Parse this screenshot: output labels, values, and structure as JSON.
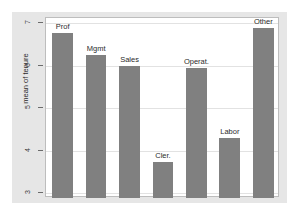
{
  "chart_data": {
    "type": "bar",
    "title": "",
    "xlabel": "",
    "ylabel": "mean of tenure",
    "categories": [
      "Prof",
      "Mgmt",
      "Sales",
      "Cler.",
      "Operat.",
      "Labor",
      "Other"
    ],
    "values": [
      6.77,
      6.24,
      5.99,
      3.74,
      5.94,
      4.29,
      6.89
    ],
    "ylim": [
      3,
      7
    ],
    "yticks": [
      3,
      4,
      5,
      6,
      7
    ],
    "ytick_labels": [
      "3",
      "4",
      "5",
      "6",
      "7"
    ],
    "grid": true,
    "legend": "none",
    "bar_color": "#808080",
    "panel_bg": "#ffffff",
    "figure_bg": "#e6e6e6",
    "axis_color": "#6b6b6b"
  },
  "axis": {
    "y_title": "mean of tenure"
  },
  "ticks": [
    {
      "label": "7",
      "value": 7
    },
    {
      "label": "6",
      "value": 6
    },
    {
      "label": "5",
      "value": 5
    },
    {
      "label": "4",
      "value": 4
    },
    {
      "label": "3",
      "value": 3
    }
  ],
  "bars": [
    {
      "label": "Prof",
      "value": 6.77
    },
    {
      "label": "Mgmt",
      "value": 6.24
    },
    {
      "label": "Sales",
      "value": 5.99
    },
    {
      "label": "Cler.",
      "value": 3.74
    },
    {
      "label": "Operat.",
      "value": 5.94
    },
    {
      "label": "Labor",
      "value": 4.29
    },
    {
      "label": "Other",
      "value": 6.89
    }
  ]
}
